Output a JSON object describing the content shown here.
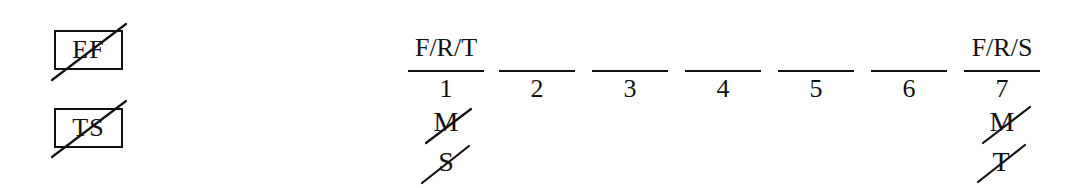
{
  "legend": {
    "items": [
      {
        "label": "EF",
        "struck": true
      },
      {
        "label": "TS",
        "struck": true
      }
    ]
  },
  "sequence": {
    "slots": [
      {
        "number": "1",
        "label": "F/R/T",
        "struck_below": [
          "M",
          "S"
        ]
      },
      {
        "number": "2",
        "label": "",
        "struck_below": []
      },
      {
        "number": "3",
        "label": "",
        "struck_below": []
      },
      {
        "number": "4",
        "label": "",
        "struck_below": []
      },
      {
        "number": "5",
        "label": "",
        "struck_below": []
      },
      {
        "number": "6",
        "label": "",
        "struck_below": []
      },
      {
        "number": "7",
        "label": "F/R/S",
        "struck_below": [
          "M",
          "T"
        ]
      }
    ]
  },
  "colors": {
    "ink": "#111111",
    "background": "#ffffff"
  }
}
